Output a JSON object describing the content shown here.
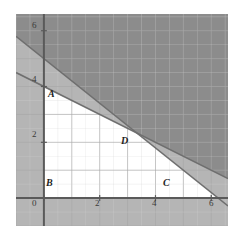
{
  "figure": {
    "background": "#ffffff"
  },
  "chart_data": {
    "type": "line",
    "title": "",
    "xlabel": "",
    "ylabel": "",
    "xlim": [
      -1,
      6.6
    ],
    "ylim": [
      -1,
      6.6
    ],
    "grid": true,
    "minor_grid_step": 0.5,
    "major_grid_step": 1,
    "legend": "none",
    "xticks": [
      0,
      2,
      4,
      6
    ],
    "xticklabels": [
      "0",
      "2",
      "4",
      "6"
    ],
    "yticks": [
      2,
      4,
      6
    ],
    "yticklabels": [
      "2",
      "4",
      "6"
    ],
    "series": [
      {
        "name": "constraint-line-1",
        "kind": "line",
        "equation": "y = 5 - 0.8x",
        "slope": -0.8,
        "intercept": 5,
        "x": [
          -1,
          6.6
        ],
        "y": [
          5.8,
          -0.28
        ],
        "color": "#6f6f6f"
      },
      {
        "name": "constraint-line-2",
        "kind": "line",
        "equation": "y = 4 - 0.5x",
        "slope": -0.5,
        "intercept": 4,
        "x": [
          -1,
          6.6
        ],
        "y": [
          4.5,
          0.7
        ],
        "color": "#6f6f6f"
      }
    ],
    "points": [
      {
        "label": "A",
        "x": 0,
        "y": 4,
        "label_dx": 6,
        "label_dy": 14
      },
      {
        "label": "B",
        "x": 0,
        "y": 0,
        "label_dx": 6,
        "label_dy": -4
      },
      {
        "label": "C",
        "x": 4.6,
        "y": 0,
        "label_dx": -2,
        "label_dy": -4
      },
      {
        "label": "D",
        "x": 3.33,
        "y": 2.33,
        "label_dx": 4,
        "label_dy": 13
      }
    ],
    "regions": [
      {
        "name": "feasible-region",
        "fill": "#ffffff",
        "vertices": [
          [
            0,
            0
          ],
          [
            0,
            4
          ],
          [
            3.33,
            2.33
          ],
          [
            4.6,
            0
          ]
        ]
      },
      {
        "name": "single-shaded-band",
        "fill": "#b5b5b5"
      },
      {
        "name": "double-shaded-region",
        "fill": "#8c8c8c"
      }
    ],
    "annotations": []
  },
  "axes": {
    "x_axis_name": "x-axis",
    "y_axis_name": "y-axis",
    "axis_color": "#5a5a5a"
  },
  "ticks": {
    "x": [
      {
        "label": "0",
        "left": 32,
        "top": 199
      },
      {
        "label": "2",
        "left": 95,
        "top": 199
      },
      {
        "label": "4",
        "left": 152,
        "top": 199
      },
      {
        "label": "6",
        "left": 209,
        "top": 199
      }
    ],
    "y": [
      {
        "label": "6",
        "left": 32,
        "top": 21
      },
      {
        "label": "4",
        "left": 32,
        "top": 75
      },
      {
        "label": "2",
        "left": 32,
        "top": 130
      }
    ]
  },
  "point_labels": [
    {
      "label": "A",
      "left": 48,
      "top": 89
    },
    {
      "label": "B",
      "left": 46,
      "top": 178
    },
    {
      "label": "C",
      "left": 163,
      "top": 178
    },
    {
      "label": "D",
      "left": 121,
      "top": 136
    }
  ],
  "colors": {
    "page_background": "#ffffff",
    "plot_background": "#ffffff",
    "minor_grid": "#d4d4d4",
    "major_grid": "#a8a8a8",
    "axis": "#5a5a5a",
    "shade_single": "#b5b5b5",
    "shade_double": "#8c8c8c",
    "line": "#6f6f6f",
    "text": "#2b2b2b"
  }
}
